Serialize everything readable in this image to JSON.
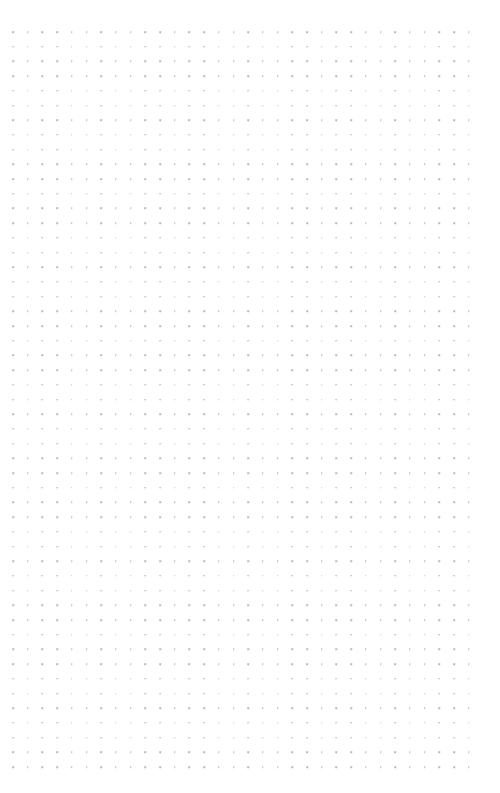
{
  "page": {
    "kind": "dot-grid-notebook-page",
    "width_px": 500,
    "height_px": 793,
    "background_color": "#ffffff",
    "description": "Blank dot grid (bullet journal) paper with no written content"
  },
  "grid": {
    "dot_color": "#b9b9bd",
    "dot_size_px": 1.6,
    "dot_shape": "square",
    "spacing_x_px": 14.7,
    "spacing_y_px": 14.7,
    "origin_x_px": 13,
    "origin_y_px": 32,
    "columns": 32,
    "rows": 51,
    "margin_left_px": 13,
    "margin_top_px": 32,
    "margin_right_px": 27,
    "margin_bottom_px": 27
  },
  "content": {
    "text_items": [],
    "note": ""
  }
}
